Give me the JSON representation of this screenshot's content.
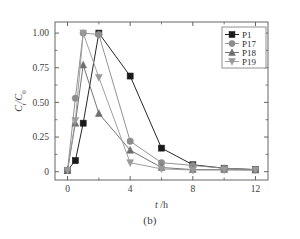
{
  "figure": {
    "caption": "(b)",
    "panel_label": "(b)"
  },
  "chart_data": {
    "type": "line",
    "title": "",
    "subtitle": "",
    "xlabel": "t /h",
    "xlabel_italic": "t",
    "xlabel_rest": "/h",
    "ylabel": "Ct/C0",
    "ylabel_main": "C",
    "ylabel_sub1": "t",
    "ylabel_slash": "/C",
    "ylabel_sub2": "0",
    "xlim": [
      -0.8,
      12.8
    ],
    "ylim": [
      -0.06,
      1.08
    ],
    "xticks": [
      0,
      4,
      8,
      12
    ],
    "xticklabels": [
      "0",
      "4",
      "8",
      "12"
    ],
    "xminorticks": [
      2,
      6,
      10
    ],
    "yticks": [
      0,
      0.25,
      0.5,
      0.75,
      1.0
    ],
    "yticklabels": [
      "0",
      "0.25",
      "0.50",
      "0.75",
      "1.00"
    ],
    "yminorticks": [
      0.125,
      0.375,
      0.625,
      0.875
    ],
    "grid": false,
    "legend_position": "top-right",
    "series": [
      {
        "name": "P1",
        "marker": "square",
        "color": "#1a1a1a",
        "x": [
          0,
          0.5,
          1,
          2,
          4,
          6,
          8,
          10,
          12
        ],
        "y": [
          0.01,
          0.08,
          0.35,
          1.0,
          0.69,
          0.17,
          0.05,
          0.025,
          0.015
        ]
      },
      {
        "name": "P17",
        "marker": "circle",
        "color": "#8c8c8c",
        "x": [
          0,
          0.5,
          1,
          2,
          4,
          6,
          8,
          10,
          12
        ],
        "y": [
          0.01,
          0.53,
          1.0,
          0.99,
          0.22,
          0.065,
          0.045,
          0.025,
          0.015
        ]
      },
      {
        "name": "P18",
        "marker": "triangle-up",
        "color": "#6e6e6e",
        "x": [
          0,
          0.5,
          1,
          2,
          4,
          6,
          8,
          10,
          12
        ],
        "y": [
          0.01,
          0.35,
          0.77,
          0.42,
          0.155,
          0.03,
          0.015,
          0.015,
          0.012
        ]
      },
      {
        "name": "P19",
        "marker": "triangle-down",
        "color": "#9a9a9a",
        "x": [
          0,
          0.5,
          1,
          2,
          4,
          6,
          8,
          10,
          12
        ],
        "y": [
          0.01,
          0.37,
          1.0,
          0.68,
          0.065,
          0.02,
          0.012,
          0.012,
          0.012
        ]
      }
    ]
  },
  "legend": {
    "items": [
      {
        "label": "P1",
        "marker": "square",
        "color": "#1a1a1a"
      },
      {
        "label": "P17",
        "marker": "circle",
        "color": "#8c8c8c"
      },
      {
        "label": "P18",
        "marker": "triangle-up",
        "color": "#6e6e6e"
      },
      {
        "label": "P19",
        "marker": "triangle-down",
        "color": "#9a9a9a"
      }
    ]
  }
}
